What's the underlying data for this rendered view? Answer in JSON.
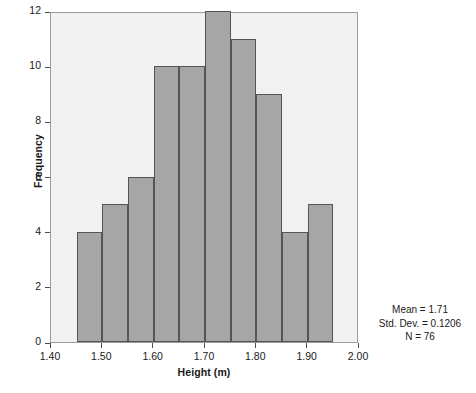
{
  "chart_data": {
    "type": "bar",
    "title": "",
    "subtitle": "",
    "xlabel": "Height (m)",
    "ylabel": "Frequency",
    "xlim": [
      1.4,
      2.0
    ],
    "ylim": [
      0,
      12
    ],
    "grid": false,
    "legend": null,
    "bin_width": 0.05,
    "bin_edges": [
      1.45,
      1.5,
      1.55,
      1.6,
      1.65,
      1.7,
      1.75,
      1.8,
      1.85,
      1.9,
      1.95
    ],
    "categories": [
      "1.45-1.50",
      "1.50-1.55",
      "1.55-1.60",
      "1.60-1.65",
      "1.65-1.70",
      "1.70-1.75",
      "1.75-1.80",
      "1.80-1.85",
      "1.85-1.90",
      "1.90-1.95"
    ],
    "values": [
      4,
      5,
      6,
      10,
      10,
      12,
      11,
      9,
      4,
      5
    ],
    "x_ticks": [
      1.4,
      1.5,
      1.6,
      1.7,
      1.8,
      1.9,
      2.0
    ],
    "x_tick_labels": [
      "1.40",
      "1.50",
      "1.60",
      "1.70",
      "1.80",
      "1.90",
      "2.00"
    ],
    "y_ticks": [
      0,
      2,
      4,
      6,
      8,
      10,
      12
    ],
    "y_tick_labels": [
      "0",
      "2",
      "4",
      "6",
      "8",
      "10",
      "12"
    ],
    "annotations": [
      "Mean = 1.71",
      "Std. Dev. = 0.1206",
      "N = 76"
    ],
    "colors": {
      "bar_fill": "#a6a6a6",
      "bar_border": "#555555",
      "plot_background": "#f1f1f1",
      "frame_border": "#9b9b9b",
      "page_background": "#ffffff",
      "text": "#1a1a1a"
    }
  },
  "axes": {
    "x_title": "Height (m)",
    "y_title": "Frequency"
  },
  "stats": {
    "mean": "Mean = 1.71",
    "std_dev": "Std. Dev. = 0.1206",
    "n": "N = 76"
  }
}
